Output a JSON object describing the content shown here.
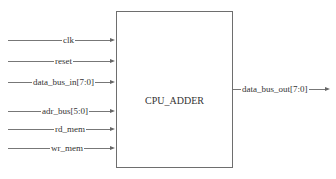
{
  "module": {
    "name": "CPU_ADDER"
  },
  "inputs": [
    {
      "label": "clk"
    },
    {
      "label": "reset"
    },
    {
      "label": "data_bus_in[7:0]"
    },
    {
      "label": "adr_bus[5:0]"
    },
    {
      "label": "rd_mem"
    },
    {
      "label": "wr_mem"
    }
  ],
  "outputs": [
    {
      "label": "data_bus_out[7:0]"
    }
  ]
}
